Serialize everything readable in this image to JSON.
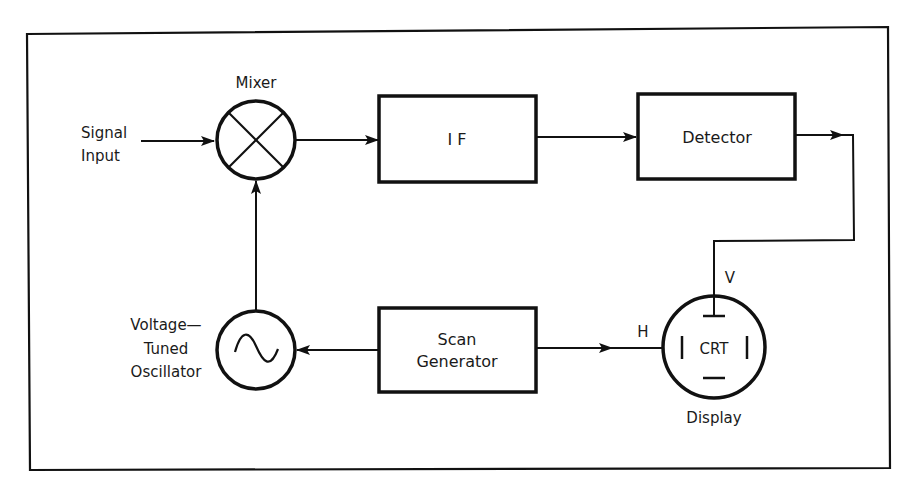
{
  "diagram": {
    "type": "block-diagram",
    "nodes": {
      "signal_input": {
        "label_line1": "Signal",
        "label_line2": "Input"
      },
      "mixer": {
        "label": "Mixer",
        "symbol": "circle-x"
      },
      "if": {
        "label": "I F"
      },
      "detector": {
        "label": "Detector"
      },
      "vto": {
        "label_line1": "Voltage—",
        "label_line2": "Tuned",
        "label_line3": "Oscillator",
        "symbol": "sine-circle"
      },
      "scan_generator": {
        "label_line1": "Scan",
        "label_line2": "Generator"
      },
      "crt": {
        "label": "CRT",
        "caption": "Display",
        "v_label": "V",
        "h_label": "H"
      }
    },
    "edges": [
      {
        "from": "Signal Input",
        "to": "Mixer"
      },
      {
        "from": "Mixer",
        "to": "IF"
      },
      {
        "from": "IF",
        "to": "Detector"
      },
      {
        "from": "Detector",
        "to": "CRT (V)"
      },
      {
        "from": "Voltage-Tuned Oscillator",
        "to": "Mixer"
      },
      {
        "from": "Scan Generator",
        "to": "Voltage-Tuned Oscillator"
      },
      {
        "from": "Scan Generator",
        "to": "CRT (H)"
      }
    ],
    "colors": {
      "stroke": "#111111",
      "background": "#ffffff"
    }
  }
}
